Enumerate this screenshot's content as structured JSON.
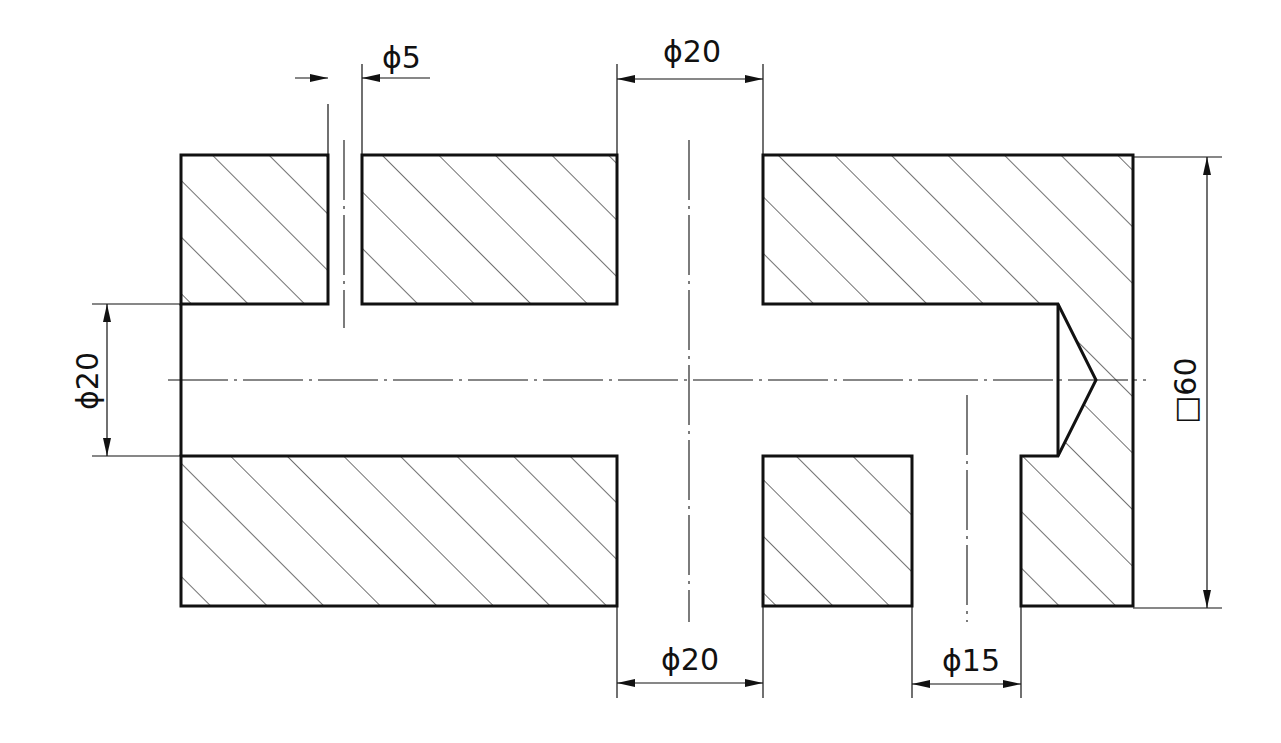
{
  "drawing": {
    "type": "sectional-view",
    "line_color": "#111111",
    "background": "#ffffff",
    "dimensions": {
      "top_small_hole": {
        "label": "ϕ5",
        "symbol": "diameter",
        "value": 5
      },
      "top_center_hole": {
        "label": "ϕ20",
        "symbol": "diameter",
        "value": 20
      },
      "left_bore": {
        "label": "ϕ20",
        "symbol": "diameter",
        "value": 20
      },
      "right_outer": {
        "label": "□60",
        "symbol": "square",
        "value": 60
      },
      "bottom_center_hole": {
        "label": "ϕ20",
        "symbol": "diameter",
        "value": 20
      },
      "bottom_right_hole": {
        "label": "ϕ15",
        "symbol": "diameter",
        "value": 15
      }
    }
  }
}
